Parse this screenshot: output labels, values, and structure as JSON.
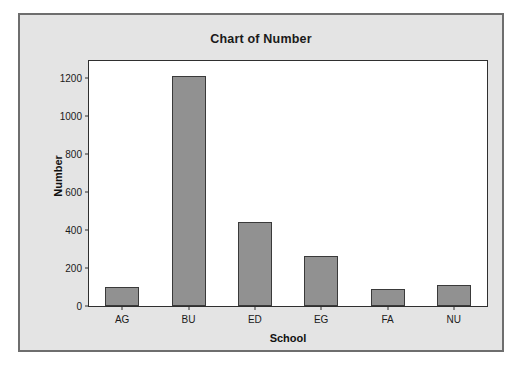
{
  "figure": {
    "background_color": "#ffffff",
    "panel_color": "#e4e4e4",
    "panel_border_color": "#6e6e6e",
    "plot_background": "#ffffff",
    "bar_fill_color": "#919191",
    "bar_edge_color": "#3a3a3a"
  },
  "chart_data": {
    "type": "bar",
    "title": "Chart of Number",
    "xlabel": "School",
    "ylabel": "Number",
    "categories": [
      "AG",
      "BU",
      "ED",
      "EG",
      "FA",
      "NU"
    ],
    "values": [
      100,
      1210,
      440,
      265,
      88,
      110
    ],
    "series": [
      {
        "name": "Number",
        "values": [
          100,
          1210,
          440,
          265,
          88,
          110
        ]
      }
    ],
    "ylim": [
      0,
      1290
    ],
    "yticks": [
      0,
      200,
      400,
      600,
      800,
      1000,
      1200
    ],
    "ytick_labels": [
      "0",
      "200",
      "400",
      "600",
      "800",
      "1000",
      "1200"
    ],
    "xtick_labels": [
      "AG",
      "BU",
      "ED",
      "EG",
      "FA",
      "NU"
    ],
    "grid": false,
    "legend": false,
    "legend_position": "none",
    "bar_color": "#919191",
    "annotations": []
  }
}
